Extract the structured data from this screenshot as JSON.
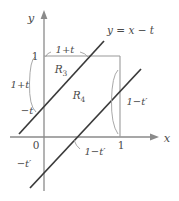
{
  "figure": {
    "type": "math-diagram",
    "axes": {
      "x_label": "x",
      "y_label": "y",
      "origin_label": "0"
    },
    "lines": {
      "upper_equation": "y = x − t",
      "upper_y_intercept_label": "−t",
      "lower_y_intercept_label": "−t′"
    },
    "regions": [
      {
        "id": "R3",
        "base": "R",
        "sub": "3"
      },
      {
        "id": "R4",
        "base": "R",
        "sub": "4"
      }
    ],
    "ticks": {
      "y_one": "1",
      "x_one": "1"
    },
    "annotations": {
      "top_segment": "1+t",
      "left_segment": "1+t",
      "right_segment": "1−t′",
      "bottom_segment": "1−t′"
    },
    "colors": {
      "background": "#ffffff",
      "axis": "#8a8a8a",
      "square_edge": "#9a9a9a",
      "diagonal": "#3a3a3a",
      "leader": "#9e9e9e",
      "text": "#4a4a4a"
    }
  }
}
